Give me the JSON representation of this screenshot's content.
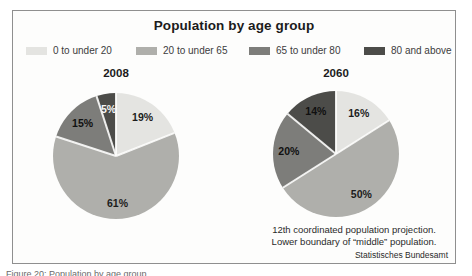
{
  "chart_data": {
    "type": "pie",
    "title": "Population by age group",
    "legend_position": "top",
    "grid": false,
    "categories": [
      "0 to under 20",
      "20 to under 65",
      "65 to under 80",
      "80 and above"
    ],
    "colors": [
      "#e4e4e1",
      "#afafab",
      "#7d7d7a",
      "#4c4c49"
    ],
    "charts": [
      {
        "year": "2008",
        "values": [
          19,
          61,
          15,
          5
        ],
        "labels": [
          "19%",
          "61%",
          "15%",
          "5%"
        ],
        "label_colors": [
          "#1c1c1c",
          "#1c1c1c",
          "#101010",
          "#f6f6f6"
        ]
      },
      {
        "year": "2060",
        "values": [
          16,
          50,
          20,
          14
        ],
        "labels": [
          "16%",
          "50%",
          "20%",
          "14%"
        ],
        "label_colors": [
          "#1c1c1c",
          "#1c1c1c",
          "#101010",
          "#101010"
        ]
      }
    ]
  },
  "footnote": {
    "line1": "12th coordinated population projection.",
    "line2": "Lower boundary of “middle” population."
  },
  "source": "Statistisches Bundesamt",
  "caption": "Figure 20: Population by age group"
}
